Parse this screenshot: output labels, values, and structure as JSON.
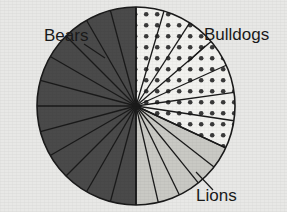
{
  "chart_data": {
    "type": "pie",
    "title": "",
    "xlabel": "",
    "ylabel": "",
    "legend_position": "none",
    "grid": false,
    "center": {
      "x": 136,
      "y": 106
    },
    "radius": 99,
    "start_angle_deg": -90,
    "direction": "counterclockwise",
    "categories": [
      "Bears",
      "Bulldogs",
      "Lions"
    ],
    "values": [
      50,
      32,
      18
    ],
    "value_unit": "percent",
    "wedge_counts": [
      12,
      7,
      5
    ],
    "angles_deg": [
      180,
      115,
      65
    ],
    "colors": [
      "#4a4a4a",
      "#f2f2ef",
      "#c9c9c4"
    ],
    "patterns": [
      "solid-dark",
      "dotted",
      "solid-light"
    ],
    "slices": [
      {
        "label": "Bears",
        "value": 50,
        "angle_deg": 180,
        "wedges": 12,
        "color": "#4a4a4a",
        "pattern": "solid-dark"
      },
      {
        "label": "Bulldogs",
        "value": 32,
        "angle_deg": 115,
        "wedges": 7,
        "color": "#f2f2ef",
        "pattern": "dotted"
      },
      {
        "label": "Lions",
        "value": 18,
        "angle_deg": 65,
        "wedges": 5,
        "color": "#c9c9c4",
        "pattern": "solid-light"
      }
    ],
    "annotations": [
      {
        "text": "Bears",
        "x": 44,
        "y": 41,
        "anchor": "start",
        "leader_from": [
          84,
          44
        ],
        "leader_to": [
          105,
          58
        ]
      },
      {
        "text": "Bulldogs",
        "x": 204,
        "y": 40,
        "anchor": "start",
        "leader_from": [
          205,
          46
        ],
        "leader_to": [
          188,
          62
        ]
      },
      {
        "text": "Lions",
        "x": 196,
        "y": 201,
        "anchor": "start",
        "leader_from": [
          213,
          190
        ],
        "leader_to": [
          196,
          172
        ]
      }
    ]
  },
  "labels": {
    "bears": "Bears",
    "bulldogs": "Bulldogs",
    "lions": "Lions"
  },
  "colors": {
    "background": "#e8e8e6",
    "bears_fill": "#4a4a4a",
    "bulldogs_fill": "#f2f2ef",
    "bulldogs_dot": "#3a3a3a",
    "lions_fill": "#c9c9c4",
    "outline": "#1a1a1a",
    "label_text": "#1a1a1a"
  }
}
